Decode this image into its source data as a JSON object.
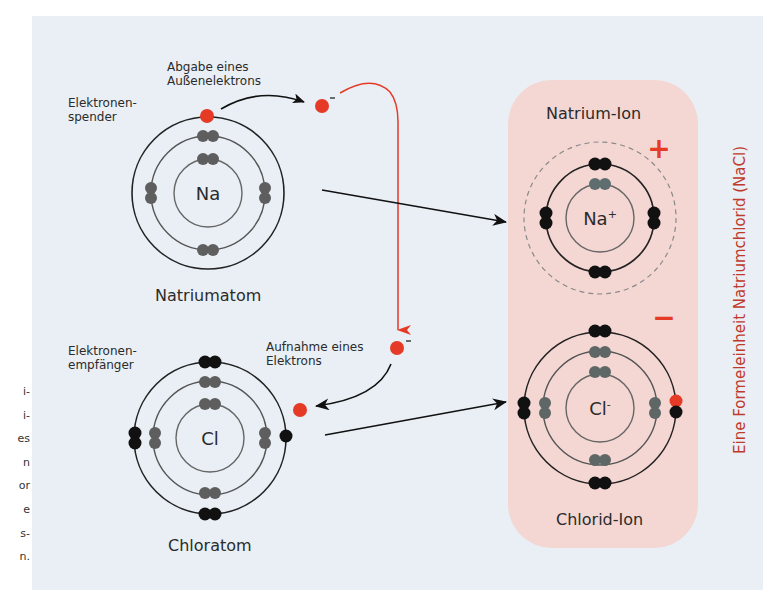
{
  "side_text": [
    "i-",
    "i-",
    "es",
    "n",
    "or",
    "e",
    "s-",
    "n."
  ],
  "labels": {
    "donor": "Elektronen-\nspender",
    "donor_line1": "Elektronen-",
    "donor_line2": "spender",
    "release_line1": "Abgabe eines",
    "release_line2": "Außenelektrons",
    "sodium_atom": "Natriumatom",
    "acceptor_line1": "Elektronen-",
    "acceptor_line2": "empfänger",
    "uptake_line1": "Aufnahme eines",
    "uptake_line2": "Elektrons",
    "chlorine_atom": "Chloratom",
    "sodium_ion": "Natrium-Ion",
    "chloride_ion": "Chlorid-Ion",
    "formula_unit": "Eine Formeleinheit Natriumchlorid (NaCl)"
  },
  "symbols": {
    "na": "Na",
    "cl": "Cl",
    "na_ion": "Na",
    "na_ion_charge": "+",
    "cl_ion": "Cl",
    "cl_ion_charge": "-",
    "electron_charge": "-"
  },
  "charges": {
    "positive": "+",
    "negative": "−"
  },
  "colors": {
    "panel": "#e9eff5",
    "ion_box": "#f4d6d3",
    "electron_transferred": "#e53b26",
    "inner_electron": "#5e5e5e",
    "outer_electron": "#111111",
    "vertical_label": "#c0392b"
  }
}
